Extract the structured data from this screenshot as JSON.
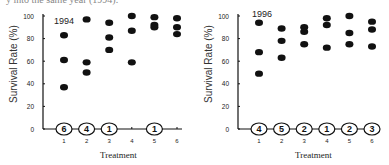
{
  "caption": "y into the same year (1994).",
  "chart_data": [
    {
      "type": "scatter",
      "title": "1994",
      "xlabel": "Treatment",
      "ylabel": "Survival Rate (%)",
      "ylim": [
        0,
        100
      ],
      "yticks": [
        "0",
        "20",
        "40",
        "60",
        "80",
        "100"
      ],
      "categories": [
        "1",
        "2",
        "3",
        "4",
        "5",
        "6"
      ],
      "points": [
        {
          "x": 1,
          "y": [
            83,
            61,
            37
          ]
        },
        {
          "x": 2,
          "y": [
            97,
            59,
            50
          ]
        },
        {
          "x": 3,
          "y": [
            94,
            81,
            70
          ]
        },
        {
          "x": 4,
          "y": [
            100,
            87,
            59
          ]
        },
        {
          "x": 5,
          "y": [
            99,
            92,
            90
          ]
        },
        {
          "x": 6,
          "y": [
            98,
            90,
            84
          ]
        }
      ],
      "zero_count_labels": [
        {
          "x": 1,
          "label": "6"
        },
        {
          "x": 2,
          "label": "4"
        },
        {
          "x": 3,
          "label": "1"
        },
        {
          "x": 5,
          "label": "1"
        }
      ],
      "grid": false,
      "legend": "none"
    },
    {
      "type": "scatter",
      "title": "1996",
      "xlabel": "Treatment",
      "ylabel": "Survival Rate (%)",
      "ylim": [
        0,
        100
      ],
      "yticks": [
        "0",
        "20",
        "40",
        "60",
        "80",
        "100"
      ],
      "categories": [
        "1",
        "2",
        "3",
        "4",
        "5",
        "6"
      ],
      "points": [
        {
          "x": 1,
          "y": [
            94,
            68,
            49
          ]
        },
        {
          "x": 2,
          "y": [
            89,
            78,
            63
          ]
        },
        {
          "x": 3,
          "y": [
            90,
            86,
            75
          ]
        },
        {
          "x": 4,
          "y": [
            98,
            92,
            72
          ]
        },
        {
          "x": 5,
          "y": [
            100,
            85,
            75
          ]
        },
        {
          "x": 6,
          "y": [
            95,
            88,
            73
          ]
        }
      ],
      "zero_count_labels": [
        {
          "x": 1,
          "label": "4"
        },
        {
          "x": 2,
          "label": "5"
        },
        {
          "x": 3,
          "label": "2"
        },
        {
          "x": 4,
          "label": "1"
        },
        {
          "x": 5,
          "label": "2"
        },
        {
          "x": 6,
          "label": "3"
        }
      ],
      "grid": false,
      "legend": "none"
    }
  ]
}
